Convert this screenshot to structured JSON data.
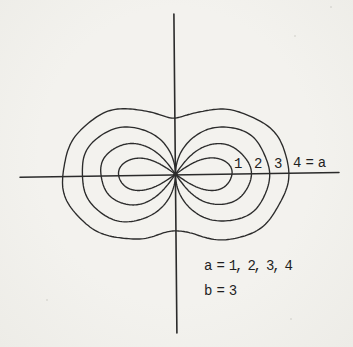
{
  "colors": {
    "background": "#f2f1ed",
    "ink": "#2b2b2b",
    "text": "#1f1f1f"
  },
  "chart_data": {
    "type": "line",
    "title": "",
    "curve_family": "hippopede",
    "polar_equation": "r^2 = 4*b*(a - b*sin(theta)^2)",
    "parameters": {
      "b": 3,
      "a_values": [
        1,
        2,
        3,
        4
      ]
    },
    "series": [
      {
        "name": "a = 1",
        "a": 1,
        "x_intercepts": [
          -3.46,
          0,
          3.46
        ],
        "max_abs_y": 1,
        "shape": "two small loops pinched at origin"
      },
      {
        "name": "a = 2",
        "a": 2,
        "x_intercepts": [
          -4.9,
          0,
          4.9
        ],
        "max_abs_y": 2,
        "shape": "two loops pinched at origin"
      },
      {
        "name": "a = 3",
        "a": 3,
        "x_intercepts": [
          -6.0,
          0,
          6.0
        ],
        "max_abs_y": 3,
        "shape": "two tangent circles meeting at origin"
      },
      {
        "name": "a = 4",
        "a": 4,
        "x_intercepts": [
          -6.93,
          6.93
        ],
        "max_abs_y": 4,
        "y_axis_waist": 3.46,
        "shape": "single peanut oval with waist on y-axis"
      }
    ],
    "axes": {
      "x_range": [
        -9.5,
        10.0
      ],
      "y_range": [
        -9.8,
        9.8
      ],
      "grid": false,
      "tick_marks": false
    },
    "annotations": {
      "x_axis_labels": [
        "1",
        "2",
        "3",
        "4 = a"
      ],
      "legend_lines": [
        "a = 1, 2, 3, 4",
        "b = 3"
      ]
    }
  }
}
